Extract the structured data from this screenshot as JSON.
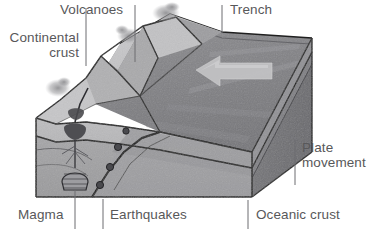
{
  "diagram": {
    "background_color": "#ffffff",
    "label_color": "#58585a",
    "leader_color": "#6d6d70"
  },
  "labels": {
    "volcanoes": "Volcanoes",
    "continental_crust": "Continental\ncrust",
    "trench": "Trench",
    "plate_movement": "Plate\nmovement",
    "oceanic_crust": "Oceanic crust",
    "earthquakes": "Earthquakes",
    "magma": "Magma"
  },
  "features": {
    "arrow": {
      "name": "plate-movement-arrow",
      "direction": "left",
      "fill": "#b9b9bb"
    },
    "earthquake_foci": [
      {
        "x": 118,
        "y": 147
      },
      {
        "x": 110,
        "y": 167
      },
      {
        "x": 100,
        "y": 185
      }
    ],
    "magma_chamber": {
      "x": 75,
      "y": 133
    },
    "magma_source": {
      "x": 75,
      "y": 172
    },
    "volcano_peaks": [
      {
        "x": 101,
        "y": 56
      },
      {
        "x": 143,
        "y": 26
      },
      {
        "x": 176,
        "y": 17
      }
    ],
    "smoke_plumes": [
      {
        "x": 58,
        "y": 88
      },
      {
        "x": 128,
        "y": 36
      },
      {
        "x": 165,
        "y": 14
      }
    ]
  },
  "colors": {
    "continental_crust_front": "#b5b5b7",
    "mantle_front": "#a0a0a2",
    "oceanic_crust_top": "#8d8d90",
    "oceanic_side_dark": "#707073",
    "ocean_surface": "#9a9a9d",
    "land_light": "#c9c9cb",
    "outline": "#1c1c1c"
  }
}
